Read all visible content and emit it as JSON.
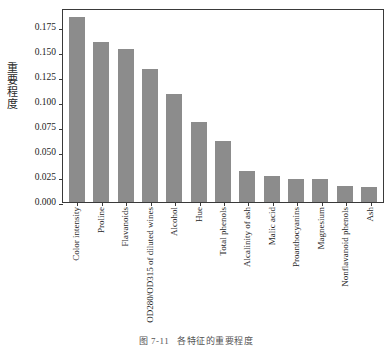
{
  "chart_data": {
    "type": "bar",
    "title": "",
    "xlabel": "",
    "ylabel": "重要程度",
    "ylim": [
      0.0,
      0.194
    ],
    "grid": false,
    "legend": null,
    "bar_color": "#8c8c8c",
    "categories": [
      "Color intensity",
      "Proline",
      "Flavanoids",
      "OD280/OD315 of diluted wines",
      "Alcohol",
      "Hue",
      "Total phenols",
      "Alcalinity of ash",
      "Malic acid",
      "Proanthocyanins",
      "Magnesium",
      "Nonflavanoid phenols",
      "Ash"
    ],
    "values": [
      0.185,
      0.16,
      0.153,
      0.133,
      0.108,
      0.08,
      0.061,
      0.031,
      0.026,
      0.023,
      0.023,
      0.016,
      0.015
    ],
    "yticks": [
      0.0,
      0.025,
      0.05,
      0.075,
      0.1,
      0.125,
      0.15,
      0.175
    ],
    "ytick_labels": [
      "0.000",
      "0.025",
      "0.050",
      "0.075",
      "0.100",
      "0.125",
      "0.150",
      "0.175"
    ]
  },
  "caption": {
    "number": "图 7-11",
    "text": "各特征的重要程度"
  }
}
